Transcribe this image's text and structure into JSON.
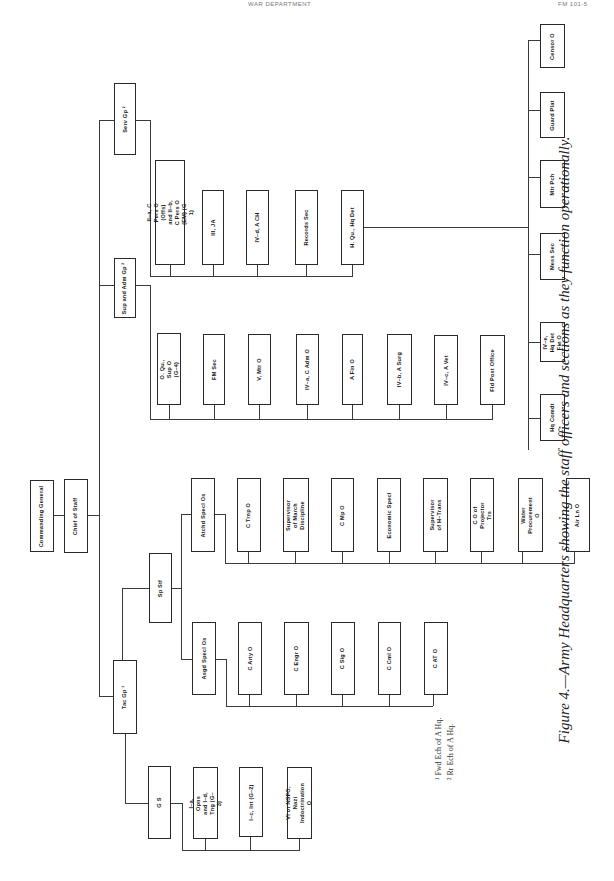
{
  "page_header": {
    "center": "WAR DEPARTMENT",
    "right": "FM 101-5"
  },
  "figure": {
    "caption": "Figure 4.—Army Headquarters showing the staff officers and sections as they function operationally.",
    "footnotes": [
      "¹ Fwd Ech of A Hq.",
      "² Rr Ech of A Hq."
    ]
  },
  "nodes": {
    "commanding_general": "Commanding General",
    "chief_of_staff": "Chief of Staff",
    "serv_gp": "Serv Gp ²",
    "sup_adm_gp": "Sup and Adm Gp ²",
    "tac_gp": "Tac Gp ¹",
    "sp_stf": "Sp Stf",
    "g_s": "G S",
    "atchd_specl_os": "Atchd Specl Os",
    "asgd_specl_os": "Asgd Specl Os",
    "hq_qu_det": "H. Qu., Hq Det"
  },
  "serv_children": [
    "II–a, C Pers O (Offs) and II–b, C Pers O (EM) (G–1)",
    "III, JA",
    "IV–d, A CH",
    "Records Sec",
    "H. Qu., Hq Det"
  ],
  "hq_det_children": [
    "Hq Comdt",
    "IV–e, Hq Det Fin O",
    "Mess Sec",
    "Mtr Pch",
    "Guard Plat",
    "Censor O"
  ],
  "sup_children": [
    "O. Qu., Sup O (G–4)",
    "FM Sec",
    "V, Mtr O",
    "IV–a, C Adm O",
    "A Fin O",
    "IV–b, A Surg",
    "IV–c, A Vet",
    "Fld Post Office"
  ],
  "atchd_children": [
    "C Trnp O",
    "Supervisor of March Discipline",
    "C Mp O",
    "Economic Specl",
    "Supervisor of H–Trans",
    "C O of Projector Trs",
    "Water Procurement O",
    "Air Ln O"
  ],
  "asgd_children": [
    "C Arty O",
    "C Engr O",
    "C Sig O",
    "C Cml O",
    "C AT O"
  ],
  "gs_children": [
    "I–a, Opns and I–d, Tng (G–3)",
    "I–c, Int (G–2)",
    "VI or NSFO, Nazi Indoctrination O"
  ]
}
